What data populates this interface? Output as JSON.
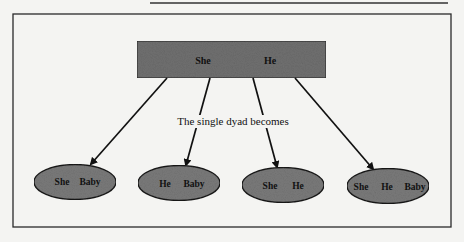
{
  "figure": {
    "top_node": {
      "label_left": "She",
      "label_right": "He",
      "fill": "#707070"
    },
    "caption": "The single dyad becomes",
    "child_nodes": [
      {
        "labels": [
          "She",
          "Baby"
        ]
      },
      {
        "labels": [
          "He",
          "Baby"
        ]
      },
      {
        "labels": [
          "She",
          "He"
        ]
      },
      {
        "labels": [
          "She",
          "He",
          "Baby"
        ]
      }
    ],
    "colors": {
      "background": "#f4f4f2",
      "frame": "#2a2a2a",
      "node_fill": "#7a7a7a",
      "ink": "#111111"
    }
  }
}
